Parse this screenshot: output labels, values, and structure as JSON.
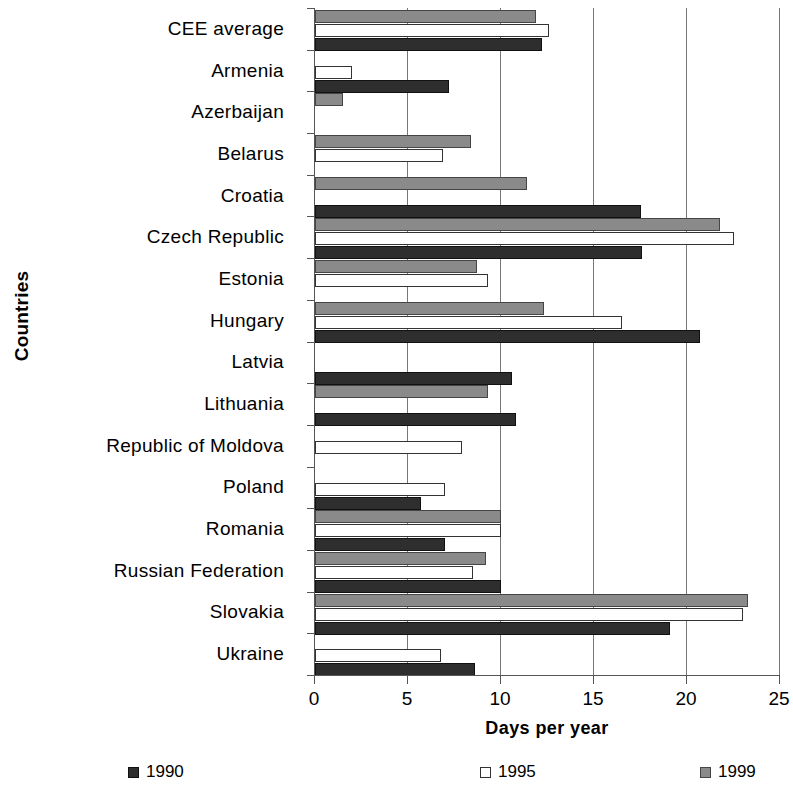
{
  "chart_data": {
    "type": "bar",
    "orientation": "horizontal",
    "title": "",
    "xlabel": "Days per year",
    "ylabel": "Countries",
    "xlim": [
      0,
      25
    ],
    "xticks": [
      0,
      5,
      10,
      15,
      20,
      25
    ],
    "grid": true,
    "legend_position": "bottom",
    "categories": [
      "CEE average",
      "Armenia",
      "Azerbaijan",
      "Belarus",
      "Croatia",
      "Czech Republic",
      "Estonia",
      "Hungary",
      "Latvia",
      "Lithuania",
      "Republic of Moldova",
      "Poland",
      "Romania",
      "Russian Federation",
      "Slovakia",
      "Ukraine"
    ],
    "series": [
      {
        "name": "1990",
        "color": "#2e2e2e",
        "values": [
          12.2,
          7.2,
          null,
          null,
          17.5,
          17.6,
          null,
          20.7,
          10.6,
          10.8,
          null,
          5.7,
          7.0,
          10.0,
          19.1,
          8.6
        ]
      },
      {
        "name": "1995",
        "color": "#ffffff",
        "values": [
          12.6,
          2.0,
          null,
          6.9,
          null,
          22.5,
          9.3,
          16.5,
          null,
          null,
          7.9,
          7.0,
          10.0,
          8.5,
          23.0,
          6.8
        ]
      },
      {
        "name": "1999",
        "color": "#8a8a8a",
        "values": [
          11.9,
          null,
          1.5,
          8.4,
          11.4,
          21.8,
          8.7,
          12.3,
          null,
          9.3,
          null,
          null,
          10.0,
          9.2,
          23.3,
          null
        ]
      }
    ]
  },
  "axis": {
    "y_title": "Countries",
    "x_title": "Days per year",
    "x_tick_labels": [
      "0",
      "5",
      "10",
      "15",
      "20",
      "25"
    ]
  },
  "legend": {
    "items": [
      {
        "label": "1990",
        "swatch": "s1990"
      },
      {
        "label": "1995",
        "swatch": "s1995"
      },
      {
        "label": "1999",
        "swatch": "s1999"
      }
    ]
  }
}
